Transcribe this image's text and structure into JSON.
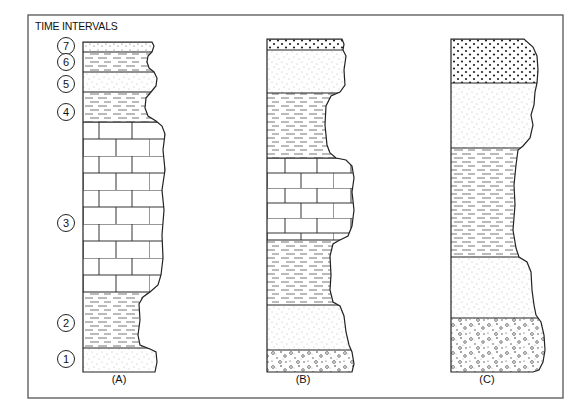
{
  "title": "TIME INTERVALS",
  "colors": {
    "ink": "#222222",
    "frame": "#555555",
    "background": "#ffffff"
  },
  "legend_lithologies": [
    "limestone",
    "shale",
    "sand",
    "coarse-sand",
    "conglomerate"
  ],
  "time_intervals": [
    {
      "label": "7",
      "cy": 46
    },
    {
      "label": "6",
      "cy": 62
    },
    {
      "label": "5",
      "cy": 84
    },
    {
      "label": "4",
      "cy": 112
    },
    {
      "label": "3",
      "cy": 223
    },
    {
      "label": "2",
      "cy": 323
    },
    {
      "label": "1",
      "cy": 359
    }
  ],
  "columns": [
    {
      "label": "(A)",
      "x": 83,
      "label_y": 383,
      "layers": [
        {
          "lithology": "coarse-sand-fine",
          "top": 42,
          "bottom": 52
        },
        {
          "lithology": "shale",
          "top": 52,
          "bottom": 72
        },
        {
          "lithology": "sand",
          "top": 72,
          "bottom": 92
        },
        {
          "lithology": "shale",
          "top": 92,
          "bottom": 122
        },
        {
          "lithology": "limestone",
          "top": 122,
          "bottom": 292
        },
        {
          "lithology": "shale",
          "top": 292,
          "bottom": 348
        },
        {
          "lithology": "sand",
          "top": 348,
          "bottom": 372
        }
      ],
      "profile": "M83,42 L152,42 L154,46 L152,52 L148,56 L147,62 L149,68 L154,72 L157,78 L156,86 L151,92 L146,98 L145,108 L148,116 L156,121 L162,126 L165,134 L163,150 L165,170 L162,190 L164,210 L162,235 L163,258 L161,275 L158,285 L150,292 L143,297 L139,304 L140,320 L138,335 L140,345 L150,349 L156,352 L157,362 L155,372 L83,372 Z"
    },
    {
      "label": "(B)",
      "x": 267,
      "label_y": 383,
      "layers": [
        {
          "lithology": "coarse-sand",
          "top": 39,
          "bottom": 50
        },
        {
          "lithology": "sand",
          "top": 50,
          "bottom": 93
        },
        {
          "lithology": "shale",
          "top": 93,
          "bottom": 158
        },
        {
          "lithology": "limestone",
          "top": 158,
          "bottom": 240
        },
        {
          "lithology": "shale",
          "top": 240,
          "bottom": 305
        },
        {
          "lithology": "sand",
          "top": 305,
          "bottom": 350
        },
        {
          "lithology": "conglomerate",
          "top": 350,
          "bottom": 372
        }
      ],
      "profile": "M267,39 L342,39 L344,44 L343,50 L346,56 L344,70 L345,85 L340,92 L331,96 L326,106 L325,125 L327,145 L330,153 L336,158 L346,160 L352,166 L354,178 L352,192 L354,210 L352,226 L348,236 L338,241 L333,244 L330,256 L331,275 L330,290 L333,302 L340,306 L344,316 L346,332 L349,345 L352,352 L354,364 L352,372 L267,372 Z"
    },
    {
      "label": "(C)",
      "x": 451,
      "label_y": 383,
      "layers": [
        {
          "lithology": "coarse-sand",
          "top": 39,
          "bottom": 83
        },
        {
          "lithology": "sand",
          "top": 83,
          "bottom": 148
        },
        {
          "lithology": "shale",
          "top": 148,
          "bottom": 257
        },
        {
          "lithology": "sand",
          "top": 257,
          "bottom": 318
        },
        {
          "lithology": "conglomerate",
          "top": 318,
          "bottom": 372
        }
      ],
      "profile": "M451,39 L524,39 L533,47 L537,56 L538,70 L537,83 L535,92 L534,105 L531,115 L533,125 L530,138 L523,146 L518,150 L516,165 L514,185 L515,205 L513,230 L516,248 L519,257 L527,262 L531,272 L532,290 L534,305 L536,315 L541,322 L544,335 L545,350 L543,362 L539,370 L533,372 L451,372 Z"
    }
  ]
}
